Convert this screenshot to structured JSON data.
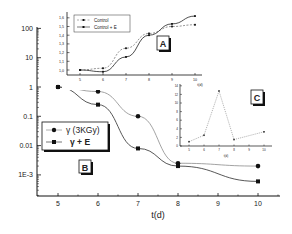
{
  "chart_data": [
    {
      "id": "main",
      "panel_label": "B",
      "type": "line",
      "title": "",
      "xlabel": "t(d)",
      "ylabel": "",
      "yscale": "log",
      "xlim": [
        4.5,
        10.5
      ],
      "ylim": [
        0.0002,
        100
      ],
      "x_ticks": [
        5,
        6,
        7,
        8,
        9,
        10
      ],
      "y_ticks": [
        100,
        10,
        1,
        0.1,
        0.01,
        0.001
      ],
      "y_tick_labels": [
        "100",
        "10",
        "1",
        "0.1",
        "0.01",
        "1E-3"
      ],
      "grid": false,
      "legend_position": "left-middle",
      "x": [
        5,
        6,
        7,
        8,
        10
      ],
      "series": [
        {
          "name": "γ (3KGy)",
          "marker": "circle",
          "values": [
            1,
            0.7,
            0.1,
            0.0025,
            0.002
          ]
        },
        {
          "name": "γ + E",
          "marker": "square",
          "values": [
            1,
            0.25,
            0.008,
            0.002,
            0.0006
          ]
        }
      ]
    },
    {
      "id": "inset-A",
      "panel_label": "A",
      "type": "line",
      "title": "",
      "xlabel": "t(d)",
      "ylabel": "",
      "xlim": [
        4.5,
        10.2
      ],
      "ylim": [
        0.95,
        1.65
      ],
      "x_ticks": [
        5,
        6,
        7,
        8,
        9,
        10
      ],
      "y_ticks": [
        1.0,
        1.1,
        1.2,
        1.3,
        1.4,
        1.5,
        1.6
      ],
      "y_tick_labels": [
        "1,0",
        "1,1",
        "1,2",
        "1,3",
        "1,4",
        "1,5",
        "1,6"
      ],
      "legend_position": "upper-left",
      "x": [
        5,
        6,
        7,
        8,
        9,
        10
      ],
      "series": [
        {
          "name": "Control",
          "style": "dashed",
          "values": [
            1.0,
            1.02,
            1.25,
            1.42,
            1.5,
            1.52
          ]
        },
        {
          "name": "Control + E",
          "style": "solid",
          "values": [
            1.0,
            0.98,
            1.15,
            1.4,
            1.53,
            1.62
          ]
        }
      ]
    },
    {
      "id": "inset-C",
      "panel_label": "C",
      "type": "line",
      "title": "",
      "xlabel": "t(d)",
      "ylabel": "",
      "xlim": [
        4.5,
        10.5
      ],
      "ylim": [
        0,
        14
      ],
      "x_ticks": [
        5,
        6,
        7,
        8,
        9,
        10
      ],
      "y_ticks": [
        0,
        2,
        4,
        6,
        8,
        10,
        12,
        14
      ],
      "x": [
        5,
        6,
        7,
        8,
        10
      ],
      "series": [
        {
          "name": "ratio",
          "style": "dotted",
          "values": [
            1,
            2.5,
            12.8,
            1.5,
            3.3
          ]
        }
      ]
    }
  ],
  "labels": {
    "main_xlabel": "t(d)",
    "panel_a": "A",
    "panel_b": "B",
    "panel_c": "C",
    "legend_main_1": "γ (3KGy)",
    "legend_main_2": "γ + E",
    "legend_a_1": "Control",
    "legend_a_2": "Control + E",
    "inset_xlabel": "t(d)"
  },
  "colors": {
    "line": "#333333",
    "axis": "#111111",
    "light_line": "#888888"
  }
}
